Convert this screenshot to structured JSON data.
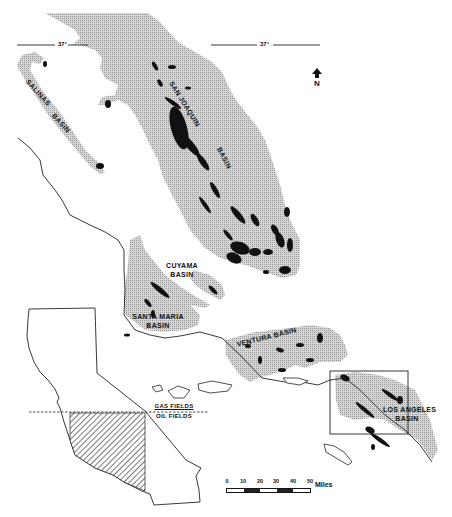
{
  "map": {
    "type": "geologic-basin-map",
    "region": "California",
    "basins": [
      {
        "name": "SAN JOAQUIN BASIN",
        "label_lines": [
          "SAN JOAQUIN",
          "BASIN"
        ]
      },
      {
        "name": "SALINAS BASIN",
        "label_lines": [
          "SALINAS",
          "BASIN"
        ]
      },
      {
        "name": "CUYAMA BASIN",
        "label_lines": [
          "CUYAMA",
          "BASIN"
        ]
      },
      {
        "name": "SANTA MARIA BASIN",
        "label_lines": [
          "SANTA MARIA",
          "BASIN"
        ]
      },
      {
        "name": "VENTURA BASIN",
        "label_lines": [
          "VENTURA BASIN"
        ]
      },
      {
        "name": "LOS ANGELES BASIN",
        "label_lines": [
          "LOS ANGELES",
          "BASIN"
        ]
      }
    ],
    "latitude_line": {
      "label": "37°"
    },
    "north_arrow": {
      "label": "N"
    },
    "inset": {
      "divider_labels": {
        "above": "GAS FIELDS",
        "below": "OIL FIELDS"
      }
    },
    "scale_bar": {
      "ticks": [
        "0",
        "10",
        "20",
        "30",
        "40",
        "50"
      ],
      "unit": "Miles"
    },
    "legend_colors": {
      "basin_fill": "#c8c8c8",
      "field_fill": "#111111",
      "coastline": "#222222",
      "background": "#ffffff"
    }
  }
}
